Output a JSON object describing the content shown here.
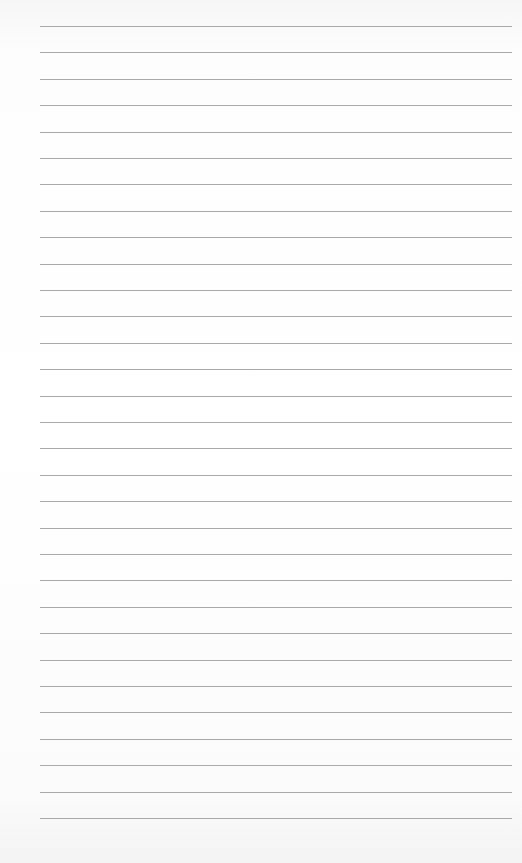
{
  "page": {
    "type": "lined-paper",
    "background_color": "#ffffff",
    "line_color": "#9a9a9a",
    "line_count": 31,
    "first_line_y": 26,
    "line_spacing": 26.4,
    "line_left": 40,
    "line_right": 512
  }
}
